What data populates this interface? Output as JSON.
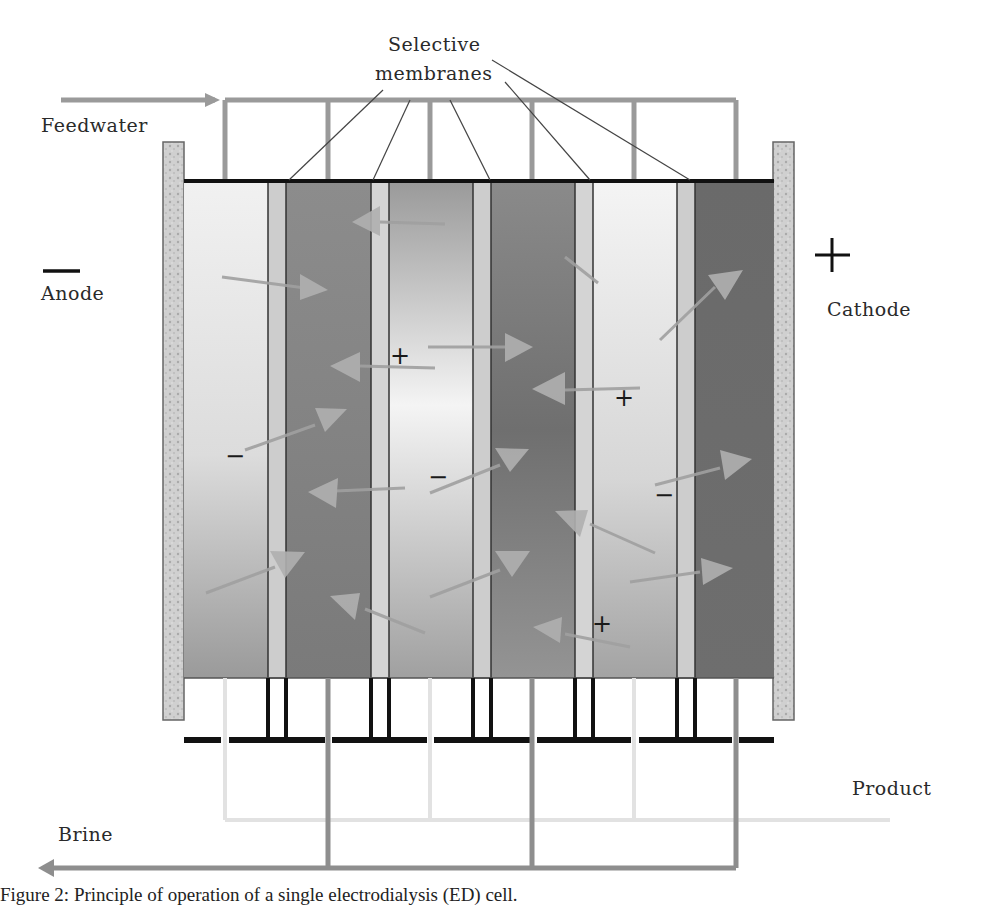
{
  "figure": {
    "title_label_line1": "Selective",
    "title_label_line2": "membranes",
    "labels": {
      "feedwater": "Feedwater",
      "anode": "Anode",
      "cathode": "Cathode",
      "product": "Product",
      "brine": "Brine"
    },
    "electrode_signs": {
      "anode": "—",
      "cathode": "+"
    },
    "ion_signs": [
      {
        "sign": "+",
        "x": 400,
        "y": 356
      },
      {
        "sign": "−",
        "x": 235,
        "y": 457
      },
      {
        "sign": "−",
        "x": 438,
        "y": 478
      },
      {
        "sign": "+",
        "x": 625,
        "y": 398
      },
      {
        "sign": "−",
        "x": 663,
        "y": 496
      },
      {
        "sign": "+",
        "x": 602,
        "y": 624
      }
    ],
    "colors": {
      "electrode": "#c8c8c8",
      "membrane": "#cfcfcf",
      "pipe": "#8e8e8e",
      "frame": "#111111",
      "arrow": "#a8a8a8"
    },
    "caption": "Figure 2:  Principle of operation of a single electrodialysis (ED) cell."
  }
}
